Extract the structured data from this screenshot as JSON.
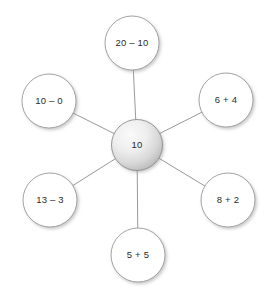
{
  "diagram": {
    "type": "spider-number-bond",
    "background_color": "#ffffff",
    "line_color": "#8c8c8c",
    "node_stroke_color": "#9a9a9a",
    "node_fill_color": "#ffffff",
    "center_fill_light": "#f4f4f4",
    "center_fill_dark": "#b9b9b9",
    "text_color": "#2b2b2b",
    "center": {
      "label": "10",
      "cx": 137,
      "cy": 145,
      "r": 25.5
    },
    "satellites": [
      {
        "id": "top",
        "label": "20 – 10",
        "cx": 132,
        "cy": 43,
        "r": 27
      },
      {
        "id": "upper-right",
        "label": "6 + 4",
        "cx": 226,
        "cy": 100,
        "r": 27
      },
      {
        "id": "lower-right",
        "label": "8 + 2",
        "cx": 228,
        "cy": 200,
        "r": 27
      },
      {
        "id": "bottom",
        "label": "5 + 5",
        "cx": 138,
        "cy": 255,
        "r": 27
      },
      {
        "id": "lower-left",
        "label": "13 – 3",
        "cx": 50,
        "cy": 200,
        "r": 27
      },
      {
        "id": "upper-left",
        "label": "10 – 0",
        "cx": 49,
        "cy": 101,
        "r": 27
      }
    ]
  }
}
